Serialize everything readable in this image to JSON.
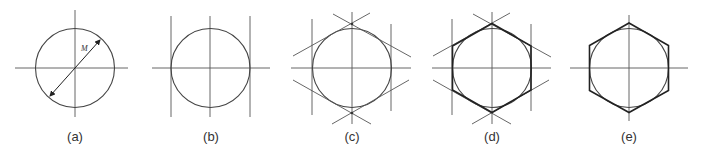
{
  "figure": {
    "panels": [
      {
        "id": "a",
        "label": "(a)",
        "step": "Draw circle with diameter M and center lines",
        "dimension_label": "M"
      },
      {
        "id": "b",
        "label": "(b)",
        "step": "Draw vertical tangent lines"
      },
      {
        "id": "c",
        "label": "(c)",
        "step": "Draw 30-degree tangent lines"
      },
      {
        "id": "d",
        "label": "(d)",
        "step": "Darken hexagon outline"
      },
      {
        "id": "e",
        "label": "(e)",
        "step": "Completed hexagon"
      }
    ],
    "colors": {
      "line": "#555555",
      "outline": "#222222",
      "background": "#ffffff"
    }
  }
}
